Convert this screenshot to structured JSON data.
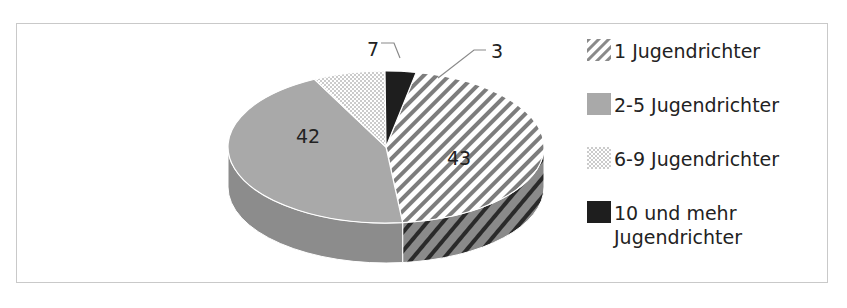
{
  "chart_data": {
    "type": "pie",
    "subtype": "3d-pie",
    "title": "",
    "categories": [
      "1 Jugendrichter",
      "2-5 Jugendrichter",
      "6-9 Jugendrichter",
      "10 und mehr Jugendrichter"
    ],
    "values": [
      43,
      42,
      7,
      3
    ],
    "data_labels": [
      "43",
      "42",
      "7",
      "3"
    ],
    "patterns": [
      "diagonal-stripes",
      "solid-gray",
      "dots",
      "solid-black"
    ],
    "colors": [
      "#7a7a7a",
      "#a9a9a9",
      "#9a9a9a",
      "#1e1e1e"
    ],
    "legend_position": "right"
  },
  "legend": {
    "items": [
      {
        "label": "1 Jugendrichter"
      },
      {
        "label": "2-5 Jugendrichter"
      },
      {
        "label": "6-9 Jugendrichter"
      },
      {
        "label": "10 und mehr Jugendrichter"
      }
    ]
  },
  "labels": {
    "s1": "43",
    "s2": "42",
    "s3": "7",
    "s4": "3"
  }
}
